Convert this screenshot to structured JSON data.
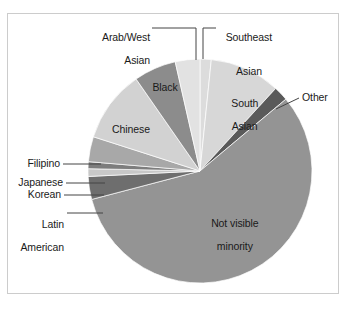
{
  "chart_data": {
    "type": "pie",
    "title": "",
    "subtitle": "",
    "xlabel": "",
    "ylabel": "",
    "legend_position": "none",
    "grid": false,
    "labels_placement": "inside-and-callout",
    "categories": [
      "Southeast Asian",
      "South Asian",
      "Other",
      "Not visible minority",
      "Latin American",
      "Korean",
      "Japanese",
      "Filipino",
      "Chinese",
      "Black",
      "Arab/West Asian"
    ],
    "values": [
      1.6,
      10.2,
      2.1,
      57.0,
      3.3,
      1.1,
      1.0,
      3.6,
      10.4,
      6.1,
      3.6
    ],
    "units": "percent",
    "slices": [
      {
        "label": "Southeast Asian",
        "value": 1.6,
        "color": "#dcdcdc",
        "start_angle": 0.0,
        "end_angle": 5.8,
        "label_mode": "callout"
      },
      {
        "label": "South Asian",
        "value": 10.2,
        "color": "#d7d7d7",
        "start_angle": 5.8,
        "end_angle": 42.5,
        "label_mode": "inside"
      },
      {
        "label": "Other",
        "value": 2.1,
        "color": "#5a5a5a",
        "start_angle": 42.5,
        "end_angle": 50.1,
        "label_mode": "callout"
      },
      {
        "label": "Not visible minority",
        "value": 57.0,
        "color": "#949494",
        "start_angle": 50.1,
        "end_angle": 255.3,
        "label_mode": "inside"
      },
      {
        "label": "Latin American",
        "value": 3.3,
        "color": "#6e6e6e",
        "start_angle": 255.3,
        "end_angle": 267.2,
        "label_mode": "callout"
      },
      {
        "label": "Korean",
        "value": 1.1,
        "color": "#c8c8c8",
        "start_angle": 267.2,
        "end_angle": 271.2,
        "label_mode": "callout"
      },
      {
        "label": "Japanese",
        "value": 1.0,
        "color": "#7d7d7d",
        "start_angle": 271.2,
        "end_angle": 274.8,
        "label_mode": "callout"
      },
      {
        "label": "Filipino",
        "value": 3.6,
        "color": "#a8a8a8",
        "start_angle": 274.8,
        "end_angle": 287.8,
        "label_mode": "callout"
      },
      {
        "label": "Chinese",
        "value": 10.4,
        "color": "#d2d2d2",
        "start_angle": 287.8,
        "end_angle": 325.2,
        "label_mode": "inside"
      },
      {
        "label": "Black",
        "value": 6.1,
        "color": "#8c8c8c",
        "start_angle": 325.2,
        "end_angle": 347.2,
        "label_mode": "inside"
      },
      {
        "label": "Arab/West Asian",
        "value": 3.6,
        "color": "#e2e2e2",
        "start_angle": 347.2,
        "end_angle": 360.0,
        "label_mode": "callout"
      }
    ]
  },
  "labels": {
    "arab_west_asian_line1": "Arab/West",
    "arab_west_asian_line2": "Asian",
    "southeast_asian_line1": "Southeast",
    "southeast_asian_line2": "Asian",
    "black": "Black",
    "south_asian_line1": "South",
    "south_asian_line2": "Asian",
    "other": "Other",
    "chinese": "Chinese",
    "filipino": "Filipino",
    "japanese": "Japanese",
    "korean": "Korean",
    "latin_american_line1": "Latin",
    "latin_american_line2": "American",
    "not_visible_minority_line1": "Not visible",
    "not_visible_minority_line2": "minority"
  },
  "colors": {
    "frame_border": "#cccccc",
    "background": "#ffffff",
    "leader_line": "#444444",
    "text": "#1a1a1a"
  }
}
